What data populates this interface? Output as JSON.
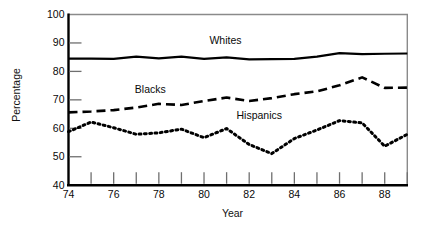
{
  "chart_data": {
    "type": "line",
    "title": "",
    "xlabel": "Year",
    "ylabel": "Percentage",
    "xlim": [
      74,
      89
    ],
    "ylim": [
      40,
      100
    ],
    "grid": false,
    "legend_position": "inline-annotations",
    "x": [
      74,
      75,
      76,
      77,
      78,
      79,
      80,
      81,
      82,
      83,
      84,
      85,
      86,
      87,
      88,
      89
    ],
    "xtick_labels": [
      "74",
      "",
      "76",
      "",
      "78",
      "",
      "80",
      "",
      "82",
      "",
      "84",
      "",
      "86",
      "",
      "88",
      ""
    ],
    "ytick_labels": [
      "40",
      "50",
      "60",
      "70",
      "80",
      "90",
      "100"
    ],
    "yticks": [
      40,
      50,
      60,
      70,
      80,
      90,
      100
    ],
    "series": [
      {
        "name": "Whites",
        "style": "solid",
        "color": "#000000",
        "values": [
          84.5,
          84.5,
          84.4,
          85.2,
          84.6,
          85.2,
          84.4,
          84.9,
          84.2,
          84.3,
          84.4,
          85.2,
          86.4,
          86.1,
          86.2,
          86.3
        ]
      },
      {
        "name": "Blacks",
        "style": "dashed",
        "color": "#000000",
        "values": [
          65.6,
          65.9,
          66.4,
          67.3,
          68.6,
          68.2,
          69.6,
          70.8,
          69.6,
          70.6,
          72.0,
          73.0,
          75.1,
          77.9,
          74.2,
          74.3
        ]
      },
      {
        "name": "Hispanics",
        "style": "dotted",
        "color": "#000000",
        "values": [
          58.8,
          62.2,
          60.2,
          57.9,
          58.4,
          59.7,
          56.7,
          59.9,
          54.3,
          51.1,
          56.4,
          59.4,
          62.7,
          61.9,
          53.7,
          57.9
        ]
      }
    ],
    "annotations": [
      {
        "text": "Whites",
        "x": 81.3,
        "y": 90.7
      },
      {
        "text": "Blacks",
        "x": 78.0,
        "y": 73.6
      },
      {
        "text": "Hispanics",
        "x": 82.5,
        "y": 64.2
      }
    ],
    "axis_colors": {
      "left_bottom": "#000000",
      "top_right": "#8a8a8a",
      "tick": "#6f6f6f"
    }
  }
}
